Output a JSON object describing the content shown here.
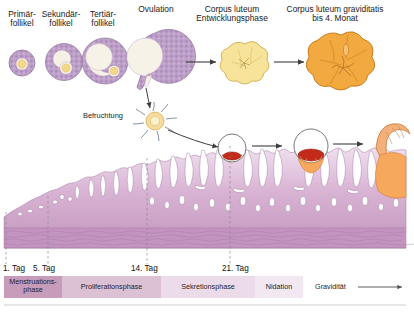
{
  "diagram": {
    "title_labels": [
      {
        "id": "primaerfollikel",
        "text": "Primär-\nfollikel",
        "x": 2,
        "y": 10,
        "w": 40
      },
      {
        "id": "sekundaerfollikel",
        "text": "Sekundär-\nfollikel",
        "x": 39,
        "y": 10,
        "w": 44
      },
      {
        "id": "tertiaerfollikel",
        "text": "Tertiär-\nfollikel",
        "x": 82,
        "y": 10,
        "w": 42
      },
      {
        "id": "ovulation",
        "text": "Ovulation",
        "x": 122,
        "y": 5,
        "w": 68
      },
      {
        "id": "corpus-luteum-entwicklungsphase",
        "text": "Corpus luteum\nEntwicklungsphase",
        "x": 190,
        "y": 5,
        "w": 84
      },
      {
        "id": "corpus-luteum-graviditatis",
        "text": "Corpus luteum graviditatis\nbis 4. Monat",
        "x": 268,
        "y": 5,
        "w": 134
      }
    ],
    "befruchtung_label": {
      "text": "Befruchtung",
      "x": 83,
      "y": 111
    },
    "day_markers": [
      {
        "label": "1. Tag",
        "x": 3,
        "tick_x": 6
      },
      {
        "label": "5. Tag",
        "x": 33,
        "tick_x": 48
      },
      {
        "label": "14. Tag",
        "x": 131,
        "tick_x": 147
      },
      {
        "label": "21. Tag",
        "x": 222,
        "tick_x": 230
      }
    ],
    "phase_bands": [
      {
        "label": "Menstruations-\nphase",
        "x": 4,
        "w": 58,
        "color": "#c79cbb"
      },
      {
        "label": "Proliferationsphase",
        "x": 62,
        "w": 99,
        "color": "#dcc0d4"
      },
      {
        "label": "Sekretionsphase",
        "x": 161,
        "w": 94,
        "color": "#ecdcea"
      },
      {
        "label": "Nidation",
        "x": 255,
        "w": 48,
        "color": "#f2e8f1"
      },
      {
        "label": "Gravidität",
        "x": 303,
        "w": 55,
        "color": "#ffffff"
      }
    ],
    "gravidity_arrow": {
      "from_x": 358,
      "to_x": 405,
      "y": 287
    },
    "colors": {
      "follicle_purple": "#b99cc4",
      "follicle_outline": "#8e6f9e",
      "oocyte_yellow": "#f4d88a",
      "corpus_luteum_yellow": "#f7e39a",
      "corpus_luteum_orange": "#f2a93f",
      "endometrium_top": "#e8d5e6",
      "endometrium_mid": "#c9a0c4",
      "endometrium_base": "#b487b0",
      "embryo_red": "#c32a1a",
      "trophoblast_orange": "#f6a85c",
      "arrow_gray": "#4a4a4a",
      "band_baseline": "#c9c9c9"
    }
  }
}
